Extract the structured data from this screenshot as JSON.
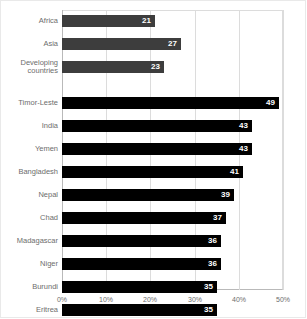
{
  "chart_data": {
    "type": "bar",
    "orientation": "horizontal",
    "title": "",
    "subtitle": "",
    "xlabel": "",
    "ylabel": "",
    "xlim": [
      0,
      50
    ],
    "grid": true,
    "legend": "none",
    "tick_labels": [
      "0%",
      "10%",
      "20%",
      "30%",
      "40%",
      "50%"
    ],
    "tick_values": [
      0,
      10,
      20,
      30,
      40,
      50
    ],
    "categories": [
      "Africa",
      "Asia",
      "Developing\ncountries",
      "Timor-Leste",
      "India",
      "Yemen",
      "Bangladesh",
      "Nepal",
      "Chad",
      "Madagascar",
      "Niger",
      "Burundi",
      "Eritrea"
    ],
    "values": [
      21,
      27,
      23,
      49,
      43,
      43,
      41,
      39,
      37,
      36,
      36,
      35,
      35
    ],
    "value_labels": [
      "21",
      "27",
      "23",
      "49",
      "43",
      "43",
      "41",
      "39",
      "37",
      "36",
      "36",
      "35",
      "35"
    ],
    "groups": [
      "aggregate",
      "aggregate",
      "aggregate",
      "country",
      "country",
      "country",
      "country",
      "country",
      "country",
      "country",
      "country",
      "country",
      "country"
    ],
    "colors": {
      "aggregate_bar": "#3d3d3d",
      "country_bar": "#000000",
      "value_label": "#ffffff",
      "category_label": "#6d6d6d",
      "gridline": "#dcdcdc",
      "axis": "#b9b9b9",
      "background": "#ffffff"
    }
  }
}
